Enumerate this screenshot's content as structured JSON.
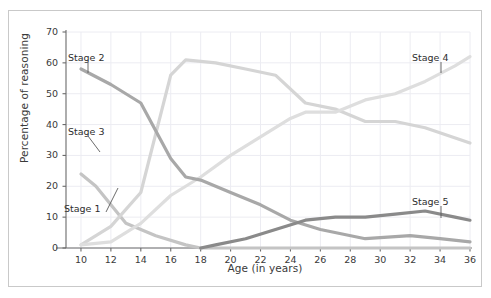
{
  "figure": {
    "border_color": "#c9c9c9",
    "background": "#ffffff"
  },
  "axis": {
    "ylabel": "Percentage of reasoning",
    "xlabel": "Age (in years)",
    "yticks": [
      "0",
      "10",
      "20",
      "30",
      "40",
      "50",
      "60",
      "70"
    ],
    "xticks": [
      "10",
      "12",
      "14",
      "16",
      "18",
      "20",
      "22",
      "24",
      "26",
      "28",
      "30",
      "32",
      "34",
      "36"
    ]
  },
  "labels": {
    "stage1": "Stage 1",
    "stage2": "Stage 2",
    "stage3": "Stage 3",
    "stage4": "Stage 4",
    "stage5": "Stage 5"
  },
  "chart_data": {
    "type": "line",
    "title": "",
    "xlabel": "Age (in years)",
    "ylabel": "Percentage of reasoning",
    "xlim": [
      9,
      36
    ],
    "ylim": [
      0,
      70
    ],
    "grid": true,
    "legend_position": "inline-annotations",
    "x": [
      10,
      11,
      13,
      15,
      17,
      18,
      20,
      22,
      24,
      25,
      27,
      29,
      31,
      33,
      35,
      36
    ],
    "series": [
      {
        "name": "Stage 1",
        "color": "#c4c4c4",
        "annotation": "Stage 1",
        "x": [
          10,
          11,
          13,
          15,
          17,
          18,
          20,
          22,
          24,
          26,
          29,
          31,
          33,
          36
        ],
        "values": [
          24,
          20,
          8,
          4,
          1,
          0,
          0,
          0,
          0,
          0,
          0,
          0,
          0,
          0
        ]
      },
      {
        "name": "Stage 2",
        "color": "#a8a8a8",
        "annotation": "Stage 2",
        "x": [
          10,
          12,
          14,
          16,
          17,
          18,
          20,
          22,
          24,
          26,
          29,
          32,
          34,
          36
        ],
        "values": [
          58,
          53,
          47,
          29,
          23,
          22,
          18,
          14,
          9,
          6,
          3,
          4,
          3,
          2
        ]
      },
      {
        "name": "Stage 3",
        "color": "#d5d5d5",
        "annotation": "Stage 3",
        "x": [
          10,
          12,
          14,
          16,
          17,
          19,
          21,
          23,
          25,
          27,
          29,
          31,
          33,
          36
        ],
        "values": [
          1,
          7,
          18,
          56,
          61,
          60,
          58,
          56,
          47,
          45,
          41,
          41,
          39,
          34
        ]
      },
      {
        "name": "Stage 4",
        "color": "#dedede",
        "annotation": "Stage 4",
        "x": [
          10,
          12,
          14,
          16,
          18,
          20,
          22,
          24,
          25,
          27,
          29,
          31,
          33,
          35,
          36
        ],
        "values": [
          1,
          2,
          8,
          17,
          23,
          30,
          36,
          42,
          44,
          44,
          48,
          50,
          54,
          59,
          62
        ]
      },
      {
        "name": "Stage 5",
        "color": "#8a8a8a",
        "annotation": "Stage 5",
        "x": [
          18,
          19,
          21,
          23,
          25,
          27,
          29,
          31,
          33,
          35,
          36
        ],
        "values": [
          0,
          1,
          3,
          6,
          9,
          10,
          10,
          11,
          12,
          10,
          9
        ]
      }
    ]
  }
}
